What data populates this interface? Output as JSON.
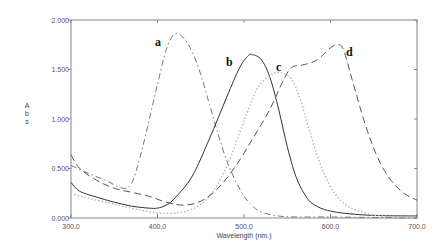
{
  "chart_data": {
    "type": "line",
    "title": "",
    "xlabel": "Wavelength (nm.)",
    "ylabel": "Abs",
    "xlim": [
      300.0,
      700.0
    ],
    "ylim": [
      0.0,
      2.0
    ],
    "x_ticks": [
      "300.0",
      "400.0",
      "500.0",
      "600.0",
      "700.0"
    ],
    "y_ticks": [
      "0.000",
      "0.500",
      "1.000",
      "1.500",
      "2.000"
    ],
    "grid": false,
    "legend": "curve labels placed near peaks",
    "series": [
      {
        "name": "a",
        "style": "dash-dot",
        "color": "#777777",
        "peak": {
          "x": 420,
          "y": 1.86
        },
        "points": [
          [
            300,
            0.53
          ],
          [
            320,
            0.45
          ],
          [
            340,
            0.38
          ],
          [
            360,
            0.3
          ],
          [
            370,
            0.35
          ],
          [
            380,
            0.62
          ],
          [
            390,
            0.98
          ],
          [
            400,
            1.35
          ],
          [
            410,
            1.7
          ],
          [
            420,
            1.86
          ],
          [
            430,
            1.82
          ],
          [
            440,
            1.68
          ],
          [
            450,
            1.45
          ],
          [
            460,
            1.15
          ],
          [
            470,
            0.85
          ],
          [
            480,
            0.58
          ],
          [
            490,
            0.38
          ],
          [
            500,
            0.22
          ],
          [
            510,
            0.12
          ],
          [
            520,
            0.06
          ],
          [
            540,
            0.02
          ],
          [
            560,
            0.01
          ],
          [
            600,
            0.01
          ],
          [
            700,
            0.0
          ]
        ]
      },
      {
        "name": "b",
        "style": "solid",
        "color": "#333333",
        "peak": {
          "x": 510,
          "y": 1.65
        },
        "points": [
          [
            300,
            0.36
          ],
          [
            310,
            0.27
          ],
          [
            330,
            0.21
          ],
          [
            350,
            0.16
          ],
          [
            370,
            0.12
          ],
          [
            390,
            0.1
          ],
          [
            400,
            0.1
          ],
          [
            410,
            0.13
          ],
          [
            420,
            0.2
          ],
          [
            440,
            0.42
          ],
          [
            460,
            0.8
          ],
          [
            480,
            1.22
          ],
          [
            495,
            1.52
          ],
          [
            505,
            1.64
          ],
          [
            510,
            1.65
          ],
          [
            520,
            1.6
          ],
          [
            530,
            1.42
          ],
          [
            540,
            1.1
          ],
          [
            550,
            0.72
          ],
          [
            560,
            0.42
          ],
          [
            570,
            0.24
          ],
          [
            580,
            0.14
          ],
          [
            600,
            0.07
          ],
          [
            640,
            0.03
          ],
          [
            700,
            0.02
          ]
        ]
      },
      {
        "name": "c",
        "style": "dotted",
        "color": "#bbbbbb",
        "peak": {
          "x": 542,
          "y": 1.47
        },
        "points": [
          [
            300,
            0.25
          ],
          [
            320,
            0.2
          ],
          [
            340,
            0.16
          ],
          [
            360,
            0.12
          ],
          [
            380,
            0.08
          ],
          [
            400,
            0.05
          ],
          [
            420,
            0.05
          ],
          [
            440,
            0.09
          ],
          [
            460,
            0.22
          ],
          [
            480,
            0.52
          ],
          [
            500,
            0.98
          ],
          [
            515,
            1.3
          ],
          [
            530,
            1.44
          ],
          [
            542,
            1.47
          ],
          [
            555,
            1.4
          ],
          [
            565,
            1.2
          ],
          [
            575,
            0.9
          ],
          [
            590,
            0.5
          ],
          [
            605,
            0.25
          ],
          [
            620,
            0.12
          ],
          [
            640,
            0.05
          ],
          [
            660,
            0.02
          ],
          [
            700,
            0.01
          ]
        ]
      },
      {
        "name": "d",
        "style": "long-dash",
        "color": "#555555",
        "peak": {
          "x": 609,
          "y": 1.75
        },
        "points": [
          [
            300,
            0.64
          ],
          [
            310,
            0.5
          ],
          [
            330,
            0.38
          ],
          [
            350,
            0.3
          ],
          [
            370,
            0.26
          ],
          [
            390,
            0.22
          ],
          [
            410,
            0.16
          ],
          [
            430,
            0.13
          ],
          [
            450,
            0.17
          ],
          [
            470,
            0.3
          ],
          [
            490,
            0.52
          ],
          [
            510,
            0.8
          ],
          [
            530,
            1.1
          ],
          [
            545,
            1.38
          ],
          [
            555,
            1.52
          ],
          [
            570,
            1.55
          ],
          [
            585,
            1.6
          ],
          [
            600,
            1.72
          ],
          [
            609,
            1.75
          ],
          [
            615,
            1.7
          ],
          [
            625,
            1.4
          ],
          [
            640,
            0.95
          ],
          [
            655,
            0.6
          ],
          [
            670,
            0.38
          ],
          [
            685,
            0.25
          ],
          [
            700,
            0.18
          ]
        ]
      }
    ]
  },
  "axes": {
    "x_title": "Wavelength (nm.)",
    "y_title_letters": [
      "A",
      "b",
      "s"
    ],
    "x_ticks": [
      "300.0",
      "400.0",
      "500.0",
      "600.0",
      "700.0"
    ],
    "y_ticks": [
      "0.000",
      "0.500",
      "1.000",
      "1.500",
      "2.000"
    ]
  },
  "labels": {
    "a": "a",
    "b": "b",
    "c": "c",
    "d": "d"
  }
}
